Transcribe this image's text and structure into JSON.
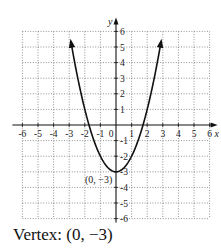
{
  "chart_data": {
    "type": "line",
    "title": "",
    "function": "y = x^2 - 3",
    "xlabel": "x",
    "ylabel": "y",
    "xlim": [
      -6,
      6
    ],
    "ylim": [
      -6,
      6
    ],
    "grid": true,
    "grid_style": "dotted",
    "x_ticks": [
      -6,
      -5,
      -4,
      -3,
      -2,
      -1,
      0,
      1,
      2,
      3,
      4,
      5,
      6
    ],
    "y_ticks": [
      -6,
      -5,
      -4,
      -3,
      -2,
      -1,
      1,
      2,
      3,
      4,
      5,
      6
    ],
    "x_tick_labels": [
      "-6",
      "-5",
      "-4",
      "-3",
      "-2",
      "-1",
      "0",
      "1",
      "2",
      "3",
      "4",
      "5",
      "6"
    ],
    "y_tick_labels": [
      "-6",
      "-5",
      "-4",
      "-3",
      "-2",
      "-1",
      "1",
      "2",
      "3",
      "4",
      "5",
      "6"
    ],
    "series": [
      {
        "name": "parabola",
        "x": [
          -3,
          -2.5,
          -2,
          -1.5,
          -1,
          -0.5,
          0,
          0.5,
          1,
          1.5,
          2,
          2.5,
          3
        ],
        "y": [
          6,
          3.25,
          1,
          -0.75,
          -2,
          -2.75,
          -3,
          -2.75,
          -2,
          -0.75,
          1,
          3.25,
          6
        ],
        "arrows": "both-ends"
      }
    ],
    "annotations": [
      {
        "text": "(0, −3)",
        "x": 0,
        "y": -3,
        "position": "left"
      }
    ],
    "legend": null
  },
  "graph": {
    "x_axis_label": "x",
    "y_axis_label": "y",
    "vertex_label": "(0, −3)"
  },
  "caption": {
    "text": "Vertex: (0, −3)"
  }
}
